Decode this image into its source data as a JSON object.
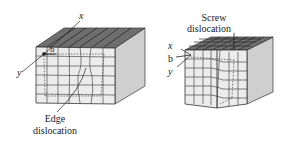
{
  "edge_figure": {
    "axis_x": "x",
    "axis_y": "y",
    "burgers": "b",
    "caption_line1": "Edge",
    "caption_line2": "dislocation"
  },
  "screw_figure": {
    "caption_line1": "Screw",
    "caption_line2": "dislocation",
    "axis_x": "x",
    "burgers": "b",
    "axis_y": "y"
  },
  "colors": {
    "top_face": "#707070",
    "side_face": "#c8c8c8",
    "front_face": "#e6e6e6",
    "lines": "#333333"
  }
}
